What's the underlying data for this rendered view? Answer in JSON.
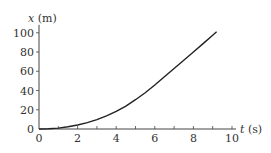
{
  "chart_data": {
    "type": "line",
    "title": "",
    "xlabel": "t (s)",
    "ylabel": "x (m)",
    "xlabel_var": "t",
    "xlabel_unit": "(s)",
    "ylabel_var": "x",
    "ylabel_unit": "(m)",
    "xlim": [
      0,
      10
    ],
    "ylim": [
      0,
      100
    ],
    "x_ticks": [
      "0",
      "2",
      "4",
      "6",
      "8",
      "10"
    ],
    "y_ticks": [
      "0",
      "20",
      "40",
      "60",
      "80",
      "100"
    ],
    "grid": false,
    "legend": null,
    "series": [
      {
        "name": "position",
        "x": [
          0,
          0.5,
          1,
          1.5,
          2,
          2.5,
          3,
          3.5,
          4,
          4.5,
          5,
          5.5,
          6,
          6.5,
          7,
          7.5,
          8,
          8.5,
          9,
          9.2
        ],
        "values": [
          0,
          0.2,
          0.8,
          1.9,
          3.5,
          5.6,
          8.3,
          11.6,
          15.5,
          20.2,
          25.8,
          32,
          38.8,
          46,
          53.3,
          60.6,
          67.8,
          75.2,
          82.6,
          85.6
        ],
        "color": "#222222"
      }
    ]
  }
}
